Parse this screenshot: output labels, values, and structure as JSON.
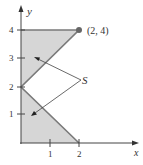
{
  "figure": {
    "type": "region-diagram",
    "axes": {
      "x_label": "x",
      "y_label": "y",
      "x_ticks": [
        "1",
        "2"
      ],
      "y_ticks": [
        "1",
        "2",
        "3",
        "4"
      ]
    },
    "point_label": "(2, 4)",
    "region_label": "S",
    "colors": {
      "region_fill": "#d6d6d6",
      "boundary": "#7a7a7a",
      "axis": "#444444",
      "text": "#333333"
    },
    "region_vertices": [
      [
        0,
        4
      ],
      [
        2,
        4
      ],
      [
        0,
        2
      ],
      [
        2,
        0
      ],
      [
        0,
        0
      ]
    ]
  }
}
